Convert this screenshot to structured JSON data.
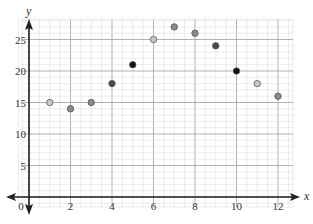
{
  "chart_data": {
    "type": "scatter",
    "title": "",
    "xlabel": "x",
    "ylabel": "y",
    "xlim": [
      -0.7,
      13.2
    ],
    "ylim": [
      -3,
      29
    ],
    "grid": true,
    "x_ticks": [
      0,
      2,
      4,
      6,
      8,
      10,
      12
    ],
    "x_tick_labels": [
      "0",
      "2",
      "4",
      "6",
      "8",
      "10",
      "12"
    ],
    "y_ticks": [
      5,
      10,
      15,
      20,
      25
    ],
    "y_tick_labels": [
      "5",
      "10",
      "15",
      "20",
      "25"
    ],
    "points": [
      {
        "x": 1,
        "y": 15,
        "shade": "light"
      },
      {
        "x": 2,
        "y": 14,
        "shade": "medium"
      },
      {
        "x": 3,
        "y": 15,
        "shade": "medium"
      },
      {
        "x": 4,
        "y": 18,
        "shade": "dark"
      },
      {
        "x": 5,
        "y": 21,
        "shade": "black"
      },
      {
        "x": 6,
        "y": 25,
        "shade": "light"
      },
      {
        "x": 7,
        "y": 27,
        "shade": "medium"
      },
      {
        "x": 8,
        "y": 26,
        "shade": "medium"
      },
      {
        "x": 9,
        "y": 24,
        "shade": "dark"
      },
      {
        "x": 10,
        "y": 20,
        "shade": "black"
      },
      {
        "x": 11,
        "y": 18,
        "shade": "light"
      },
      {
        "x": 12,
        "y": 16,
        "shade": "medium"
      }
    ],
    "colors": {
      "light": "#c8c8c8",
      "medium": "#8a8a8a",
      "dark": "#4a4a4a",
      "black": "#111111",
      "grid_minor": "#dddddd",
      "grid_major": "#a8a8a8",
      "axis": "#222222"
    }
  }
}
